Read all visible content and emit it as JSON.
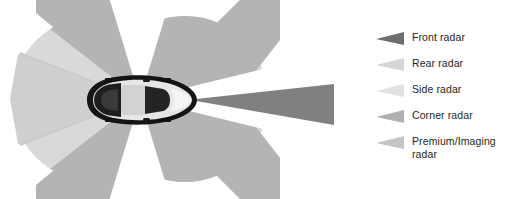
{
  "figure": {
    "background_color": "#ffffff",
    "width": 513,
    "height": 199
  },
  "diagram": {
    "name": "radar-coverage-diagram",
    "vehicle": {
      "description": "top-down sports car, front facing right",
      "body_color": "#e9e9e9",
      "outline_color": "#1a1a1a",
      "glass_color": "#2b2b2b"
    },
    "zones": [
      {
        "id": "front-radar-beam",
        "label": "Front radar",
        "color": "#808080",
        "direction": "forward",
        "shape": "narrow long beam"
      },
      {
        "id": "corner-radar-front-left",
        "label": "Corner radar",
        "color": "#b4b4b4",
        "direction": "front-left diagonal",
        "shape": "wide sector"
      },
      {
        "id": "corner-radar-front-right",
        "label": "Corner radar",
        "color": "#b4b4b4",
        "direction": "front-right diagonal",
        "shape": "wide sector"
      },
      {
        "id": "corner-radar-rear-left",
        "label": "Corner radar",
        "color": "#b4b4b4",
        "direction": "rear-left diagonal",
        "shape": "wide sector"
      },
      {
        "id": "corner-radar-rear-right",
        "label": "Corner radar",
        "color": "#b4b4b4",
        "direction": "rear-right diagonal",
        "shape": "wide sector"
      },
      {
        "id": "side-radar-left",
        "label": "Side radar",
        "color": "#d9d9d9",
        "direction": "left lateral",
        "shape": "sector"
      },
      {
        "id": "side-radar-right",
        "label": "Side radar",
        "color": "#d9d9d9",
        "direction": "right lateral",
        "shape": "sector"
      },
      {
        "id": "rear-radar",
        "label": "Rear radar",
        "color": "#cfcfcf",
        "direction": "rearward",
        "shape": "sector"
      }
    ]
  },
  "legend": {
    "name": "radar-type-legend",
    "items": [
      {
        "label": "Front radar",
        "color": "#6e6e6e"
      },
      {
        "label": "Rear radar",
        "color": "#d6d6d6"
      },
      {
        "label": "Side radar",
        "color": "#e2e2e2"
      },
      {
        "label": "Corner radar",
        "color": "#b0b0b0"
      },
      {
        "label": "Premium/Imaging\nradar",
        "color": "#c4c4c4"
      }
    ]
  }
}
